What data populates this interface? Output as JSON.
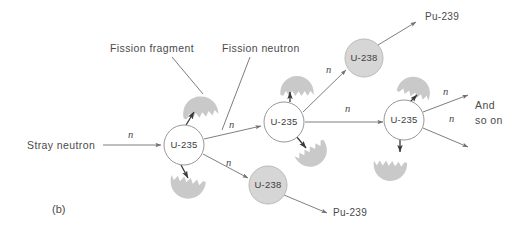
{
  "figure": {
    "panel_label": "(b)",
    "background": "#ffffff",
    "line_color": "#6f6f6f",
    "text_color": "#4a4a4a",
    "fragment_fill": "#c9c9c9",
    "u238_fill": "#d6d6d6",
    "u235_fill": "#ffffff"
  },
  "annotations": {
    "fission_fragment": "Fission fragment",
    "fission_neutron": "Fission neutron",
    "stray_neutron": "Stray neutron",
    "and_line1": "And",
    "and_line2": "so on"
  },
  "nuclei": [
    {
      "id": "u235-1",
      "label": "U-235",
      "cx": 184,
      "cy": 145,
      "r": 20,
      "kind": "u235"
    },
    {
      "id": "u235-2",
      "label": "U-235",
      "cx": 284,
      "cy": 122,
      "r": 20,
      "kind": "u235"
    },
    {
      "id": "u235-3",
      "label": "U-235",
      "cx": 404,
      "cy": 120,
      "r": 20,
      "kind": "u235"
    },
    {
      "id": "u238-top",
      "label": "U-238",
      "cx": 364,
      "cy": 58,
      "r": 19,
      "kind": "u238"
    },
    {
      "id": "u238-bottom",
      "label": "U-238",
      "cx": 268,
      "cy": 185,
      "r": 19,
      "kind": "u238"
    }
  ],
  "products": [
    {
      "id": "pu-239-top",
      "label": "Pu-239",
      "x": 425,
      "y": 20
    },
    {
      "id": "pu-239-bottom",
      "label": "Pu-239",
      "x": 333,
      "y": 216
    }
  ],
  "neutron_marks": [
    {
      "id": "n-stray",
      "label": "n",
      "x": 128,
      "y": 138
    },
    {
      "id": "n-to-u235-2",
      "label": "n",
      "x": 229,
      "y": 128
    },
    {
      "id": "n-to-u238-bottom",
      "label": "n",
      "x": 226,
      "y": 166
    },
    {
      "id": "n-to-u238-top",
      "label": "n",
      "x": 326,
      "y": 73
    },
    {
      "id": "n-to-u235-3",
      "label": "n",
      "x": 345,
      "y": 112
    },
    {
      "id": "n-and-so-on-upper",
      "label": "n",
      "x": 443,
      "y": 95
    },
    {
      "id": "n-and-so-on-lower",
      "label": "n",
      "x": 449,
      "y": 122
    }
  ],
  "fragments": [
    {
      "id": "fragment-1",
      "cx": 200,
      "cy": 108,
      "rot": -8,
      "scale": 1.0
    },
    {
      "id": "fragment-2",
      "cx": 187,
      "cy": 187,
      "rot": 192,
      "scale": 1.0
    },
    {
      "id": "fragment-3",
      "cx": 297,
      "cy": 87,
      "rot": 0,
      "scale": 0.95
    },
    {
      "id": "fragment-4",
      "cx": 313,
      "cy": 155,
      "rot": 150,
      "scale": 0.95
    },
    {
      "id": "fragment-5",
      "cx": 390,
      "cy": 170,
      "rot": 184,
      "scale": 0.95
    },
    {
      "id": "fragment-6",
      "cx": 415,
      "cy": 88,
      "rot": 18,
      "scale": 0.95
    }
  ],
  "chain_arrows": [
    {
      "id": "arrow-stray-to-u235-1",
      "from": [
        103,
        145
      ],
      "to": [
        161,
        145
      ]
    },
    {
      "id": "arrow-u235-1-to-u235-2",
      "from": [
        204,
        139
      ],
      "to": [
        261,
        126
      ]
    },
    {
      "id": "arrow-u235-1-to-u238-bottom",
      "from": [
        203,
        154
      ],
      "to": [
        248,
        178
      ]
    },
    {
      "id": "arrow-u235-2-to-u238-top",
      "from": [
        303,
        112
      ],
      "to": [
        346,
        70
      ]
    },
    {
      "id": "arrow-u235-2-to-u235-3",
      "from": [
        305,
        122
      ],
      "to": [
        383,
        122
      ]
    },
    {
      "id": "arrow-u238-top-to-pu239",
      "from": [
        378,
        45
      ],
      "to": [
        416,
        22
      ]
    },
    {
      "id": "arrow-u238-bottom-to-pu239",
      "from": [
        284,
        195
      ],
      "to": [
        327,
        213
      ]
    },
    {
      "id": "arrow-u235-3-and-upper",
      "from": [
        423,
        112
      ],
      "to": [
        468,
        95
      ]
    },
    {
      "id": "arrow-u235-3-and-lower",
      "from": [
        423,
        128
      ],
      "to": [
        468,
        147
      ]
    }
  ],
  "fragment_arrows": [
    {
      "id": "frag-arrow-1",
      "from": [
        186,
        125
      ],
      "to": [
        194,
        112
      ]
    },
    {
      "id": "frag-arrow-2",
      "from": [
        181,
        165
      ],
      "to": [
        188,
        178
      ]
    },
    {
      "id": "frag-arrow-3",
      "from": [
        290,
        102
      ],
      "to": [
        290,
        92
      ]
    },
    {
      "id": "frag-arrow-4",
      "from": [
        296,
        136
      ],
      "to": [
        306,
        148
      ]
    },
    {
      "id": "frag-arrow-5",
      "from": [
        400,
        138
      ],
      "to": [
        400,
        152
      ]
    },
    {
      "id": "frag-arrow-6",
      "from": [
        408,
        104
      ],
      "to": [
        417,
        95
      ]
    }
  ],
  "leaders": [
    {
      "id": "leader-fission-fragment",
      "from": [
        172,
        57
      ],
      "to": [
        203,
        94
      ]
    },
    {
      "id": "leader-fission-neutron",
      "from": [
        250,
        57
      ],
      "to": [
        222,
        130
      ]
    }
  ]
}
